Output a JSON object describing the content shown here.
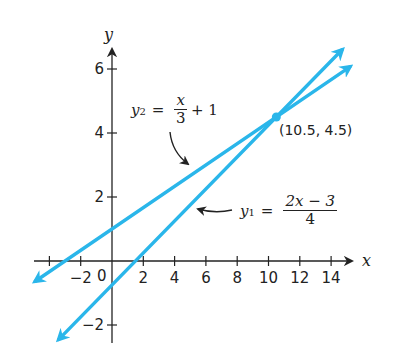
{
  "chart_data": {
    "type": "line",
    "title": "",
    "xlabel": "x",
    "ylabel": "y",
    "xlim": [
      -5,
      15.5
    ],
    "ylim": [
      -2.5,
      6.8
    ],
    "grid": false,
    "x_ticks": [
      -4,
      -2,
      0,
      2,
      4,
      6,
      8,
      10,
      12,
      14
    ],
    "x_tick_labels": [
      "",
      "−2",
      "0",
      "2",
      "4",
      "6",
      "8",
      "10",
      "12",
      "14"
    ],
    "y_ticks": [
      -2,
      2,
      4,
      6
    ],
    "y_tick_labels": [
      "−2",
      "2",
      "4",
      "6"
    ],
    "series": [
      {
        "name": "y1",
        "label": "y₁ = (2x − 3)/4",
        "equation": {
          "lhs": "y",
          "sub": "1",
          "num": "2x − 3",
          "den": "4",
          "tail": ""
        },
        "slope": 0.5,
        "intercept": -0.75,
        "x_range": [
          -3.4,
          14.7
        ],
        "color": "#2ab6ea"
      },
      {
        "name": "y2",
        "label": "y₂ = x/3 + 1",
        "equation": {
          "lhs": "y",
          "sub": "2",
          "num": "x",
          "den": "3",
          "tail": "+ 1"
        },
        "slope": 0.3333,
        "intercept": 1,
        "x_range": [
          -4.9,
          15.2
        ],
        "color": "#2ab6ea"
      }
    ],
    "annotations": [
      {
        "type": "point",
        "x": 10.5,
        "y": 4.5,
        "text": "(10.5, 4.5)"
      }
    ]
  }
}
